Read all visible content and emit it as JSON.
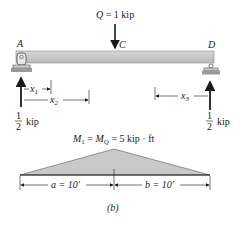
{
  "load": {
    "label": "Q = 1 kip"
  },
  "points": {
    "A": "A",
    "C": "C",
    "D": "D"
  },
  "dimensions": {
    "x1": {
      "var": "x",
      "sub": "1"
    },
    "x2": {
      "var": "x",
      "sub": "2"
    },
    "x3": {
      "var": "x",
      "sub": "3"
    }
  },
  "reactions": {
    "left": {
      "num": "1",
      "den": "2",
      "unit": "kip"
    },
    "right": {
      "num": "1",
      "den": "2",
      "unit": "kip"
    }
  },
  "moment_diagram": {
    "label_m1": "M",
    "label_m1_sub": "1",
    "label_eq1": " = ",
    "label_mq": "M",
    "label_mq_sub": "Q",
    "label_value": " = 5 kip · ft",
    "a_label": "a = 10′",
    "b_label": "b = 10′"
  },
  "caption": "(b)",
  "colors": {
    "beam": "#c8c8c8",
    "moment_fill": "#c9c9c9",
    "ink": "#1a1a1a"
  }
}
